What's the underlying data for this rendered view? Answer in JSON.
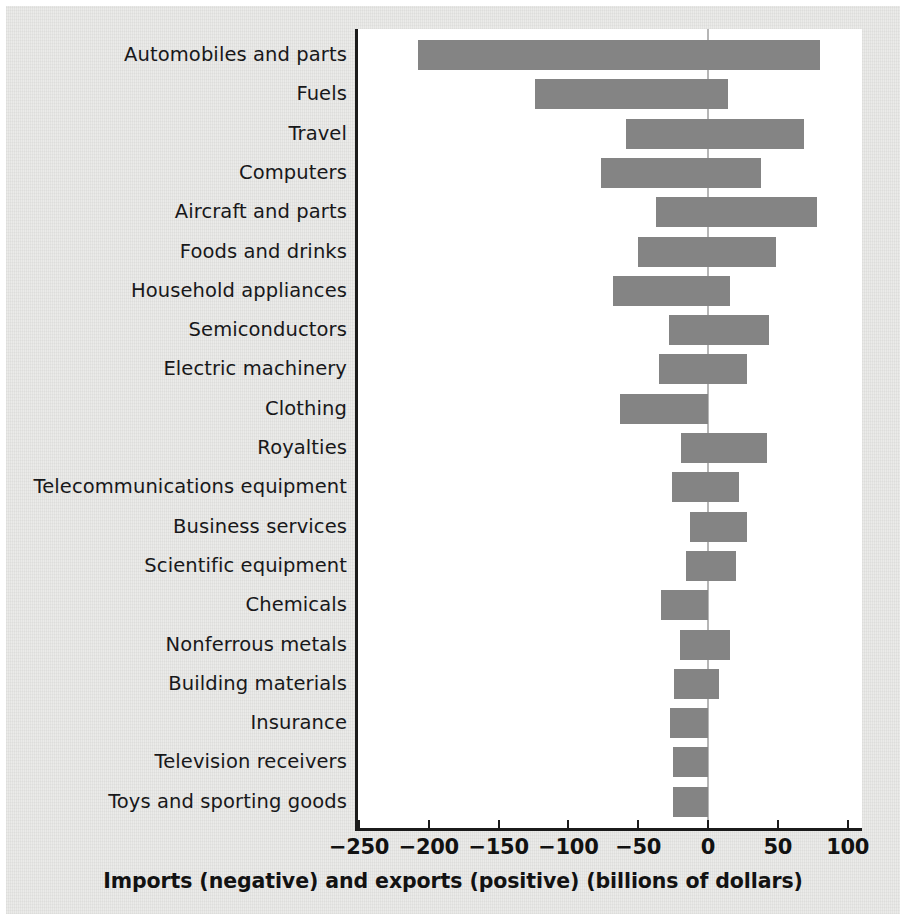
{
  "figure": {
    "background_color": "#e9e9e7",
    "plot_background_color": "#ffffff",
    "bar_color": "#848484",
    "axis_color": "#1b1b1b",
    "zero_line_color": "#b6b6b6"
  },
  "chart_data": {
    "type": "bar",
    "orientation": "horizontal",
    "title": "",
    "xlabel": "Imports (negative) and exports (positive) (billions of dollars)",
    "ylabel": "",
    "xlim": [
      -250,
      115
    ],
    "xticks": [
      -250,
      -200,
      -150,
      -100,
      -50,
      0,
      50,
      100
    ],
    "xticklabels": [
      "−250",
      "−200",
      "−150",
      "−100",
      "−50",
      "0",
      "50",
      "100"
    ],
    "grid": false,
    "legend": null,
    "note": "Each category shows one bar spanning from its imports value (negative) to its exports value (positive).",
    "categories": [
      "Automobiles and parts",
      "Fuels",
      "Travel",
      "Computers",
      "Aircraft and parts",
      "Foods and drinks",
      "Household appliances",
      "Semiconductors",
      "Electric machinery",
      "Clothing",
      "Royalties",
      "Telecommunications equipment",
      "Business services",
      "Scientific equipment",
      "Chemicals",
      "Nonferrous metals",
      "Building materials",
      "Insurance",
      "Television receivers",
      "Toys and sporting goods"
    ],
    "series": [
      {
        "name": "Imports (negative)",
        "values": [
          -208,
          -124,
          -59,
          -77,
          -37,
          -50,
          -68,
          -28,
          -35,
          -63,
          -19,
          -26,
          -13,
          -16,
          -34,
          -20,
          -24,
          -27,
          -25,
          -25
        ]
      },
      {
        "name": "Exports (positive)",
        "values": [
          80,
          14,
          69,
          38,
          78,
          49,
          16,
          44,
          28,
          0,
          42,
          22,
          28,
          20,
          0,
          16,
          8,
          0,
          0,
          0
        ]
      }
    ]
  }
}
